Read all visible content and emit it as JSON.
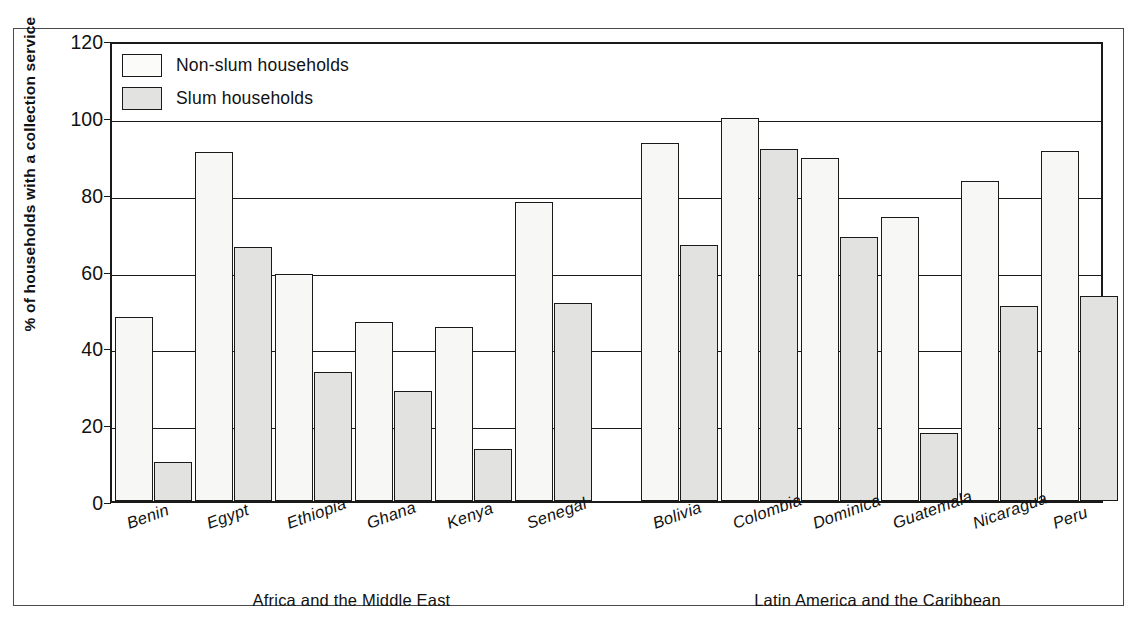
{
  "chart_data": {
    "type": "bar",
    "title": "",
    "xlabel": "",
    "ylabel": "% of households with a collection service",
    "ylim": [
      0,
      120
    ],
    "yticks": [
      0,
      20,
      40,
      60,
      80,
      100,
      120
    ],
    "grid": true,
    "legend_position": "top-left",
    "legend": [
      {
        "name": "Non-slum households",
        "color": "#f7f7f5"
      },
      {
        "name": "Slum households",
        "color": "#e2e2e0"
      }
    ],
    "groups": [
      {
        "label": "Africa and the Middle East",
        "categories": [
          "Benin",
          "Egypt",
          "Ethiopia",
          "Ghana",
          "Kenya",
          "Senegal"
        ]
      },
      {
        "label": "Latin America and the Caribbean",
        "categories": [
          "Bolivia",
          "Colombia",
          "Dominica",
          "Guatemala",
          "Nicaragua",
          "Peru"
        ]
      }
    ],
    "categories": [
      "Benin",
      "Egypt",
      "Ethiopia",
      "Ghana",
      "Kenya",
      "Senegal",
      "Bolivia",
      "Colombia",
      "Dominica",
      "Guatemala",
      "Nicaragua",
      "Peru"
    ],
    "series": [
      {
        "name": "Non-slum households",
        "values": [
          47.8,
          90.8,
          59.2,
          46.6,
          45.4,
          77.8,
          93.3,
          99.8,
          89.2,
          74.0,
          83.4,
          91.0
        ]
      },
      {
        "name": "Slum households",
        "values": [
          10.2,
          66.1,
          33.5,
          28.7,
          13.6,
          51.5,
          66.6,
          91.7,
          68.6,
          17.8,
          50.8,
          53.4
        ]
      }
    ]
  },
  "axis": {
    "y_title": "% of households with a collection service",
    "tick_labels": [
      "120",
      "100",
      "80",
      "60",
      "40",
      "20",
      "0"
    ]
  }
}
